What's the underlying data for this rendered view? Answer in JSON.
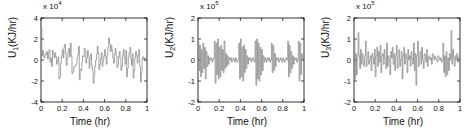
{
  "figure": {
    "background": "#ffffff",
    "line_color": "#808080",
    "axis_color": "#000000",
    "text_color": "#111111"
  },
  "chart_data": [
    {
      "type": "line",
      "title": "",
      "subplot_index": 1,
      "xlabel": "Time (hr)",
      "ylabel": "U_1(KJ/hr)",
      "ylabel_base": "U",
      "ylabel_sub": "1",
      "ylabel_unit": "(KJ/hr)",
      "exponent_prefix": "x 10",
      "exponent_power": "4",
      "y_scale": 10000,
      "xlim": [
        0,
        1
      ],
      "ylim": [
        -4,
        4
      ],
      "xticks": [
        "0",
        "0.2",
        "0.4",
        "0.6",
        "0.8",
        "1"
      ],
      "xtick_values": [
        0,
        0.2,
        0.4,
        0.6,
        0.8,
        1
      ],
      "yticks": [
        "4",
        "2",
        "0",
        "-2",
        "-4"
      ],
      "ytick_values": [
        4,
        2,
        0,
        -2,
        -4
      ],
      "grid": false,
      "legend": null,
      "drawstyle": "steps-post",
      "values": [
        3.1,
        0.4,
        0.9,
        0.3,
        0.2,
        0.6,
        0.5,
        0.8,
        0.1,
        0.7,
        1.0,
        -0.2,
        0.2,
        -0.6,
        0.9,
        0.5,
        0.2,
        0.7,
        0.3,
        -0.4,
        -0.1,
        0.3,
        -1.8,
        -1.6,
        -0.3,
        0.4,
        1.0,
        0.2,
        1.2,
        1.5,
        0.6,
        -0.5,
        0.1,
        0.8,
        1.1,
        0.3,
        1.6,
        0.4,
        -1.3,
        -1.1,
        -0.7,
        -0.6,
        -0.5,
        -0.4,
        0.1,
        0.5,
        1.3,
        -1.9,
        -0.9,
        -1.0,
        -0.2,
        0.4,
        0.3,
        1.1,
        0.8,
        -0.3,
        0.2,
        0.9,
        0.4,
        -0.8,
        0.1,
        0.6,
        -0.5,
        -1.0,
        -2.2,
        -1.4,
        -0.6,
        0.0,
        0.5,
        1.3,
        0.6,
        -0.9,
        -0.4,
        0.2,
        0.7,
        -0.6,
        -0.1,
        0.4,
        1.0,
        0.3,
        -0.4,
        0.5,
        1.2,
        2.1,
        1.5,
        0.8,
        1.4,
        0.9,
        0.2,
        -0.3,
        0.6,
        1.1,
        0.4,
        -0.7,
        -0.5,
        0.3,
        0.8,
        0.1,
        -1.0,
        -0.6,
        0.5,
        1.0,
        0.2,
        -0.4,
        0.9,
        -1.6,
        -0.8,
        0.3,
        0.7,
        1.2,
        0.1,
        -0.5,
        0.6,
        -1.7,
        -1.0,
        0.2,
        0.8,
        0.4,
        -0.3,
        0.5,
        1.0,
        -0.6,
        -2.1,
        -1.2,
        0.1,
        0.3,
        0.0,
        0.2,
        -0.1,
        0.1
      ]
    },
    {
      "type": "line",
      "title": "",
      "subplot_index": 2,
      "xlabel": "Time (hr)",
      "ylabel": "U_2(KJ/hr)",
      "ylabel_base": "U",
      "ylabel_sub": "2",
      "ylabel_unit": "(KJ/hr)",
      "exponent_prefix": "x 10",
      "exponent_power": "5",
      "y_scale": 100000,
      "xlim": [
        0,
        1
      ],
      "ylim": [
        -2,
        2
      ],
      "xticks": [
        "0",
        "0.2",
        "0.4",
        "0.6",
        "0.8",
        "1"
      ],
      "xtick_values": [
        0,
        0.2,
        0.4,
        0.6,
        0.8,
        1
      ],
      "yticks": [
        "2",
        "1",
        "0",
        "-1",
        "-2"
      ],
      "ytick_values": [
        2,
        1,
        0,
        -1,
        -2
      ],
      "grid": false,
      "legend": null,
      "drawstyle": "steps-post",
      "values": [
        0.9,
        -0.5,
        0.7,
        -0.8,
        0.5,
        -0.6,
        0.8,
        -0.4,
        0.6,
        -0.9,
        0.4,
        -0.3,
        0.2,
        -0.2,
        0.1,
        0.0,
        0.1,
        -0.1,
        0.0,
        0.1,
        0.9,
        -1.1,
        0.8,
        -0.7,
        1.0,
        -0.9,
        0.6,
        -0.8,
        0.7,
        -0.5,
        0.5,
        -0.6,
        0.9,
        -0.4,
        0.3,
        -0.3,
        0.2,
        -0.2,
        0.1,
        0.0,
        0.1,
        -0.1,
        0.0,
        0.1,
        0.0,
        -0.1,
        0.1,
        0.0,
        -0.1,
        0.0,
        0.8,
        -0.9,
        1.0,
        -0.8,
        0.6,
        -1.0,
        0.7,
        -0.6,
        0.5,
        -0.4,
        0.2,
        -0.2,
        0.1,
        0.0,
        0.1,
        -0.1,
        0.0,
        0.1,
        0.0,
        -0.1,
        0.9,
        -1.2,
        1.0,
        -0.9,
        0.8,
        -1.0,
        0.6,
        -0.7,
        0.5,
        -0.5,
        0.2,
        -0.1,
        0.1,
        0.0,
        -0.1,
        0.1,
        0.0,
        0.1,
        -0.1,
        0.0,
        0.8,
        -0.6,
        0.7,
        -0.5,
        0.3,
        -0.3,
        0.1,
        0.0,
        0.1,
        -0.1,
        0.0,
        0.1,
        0.0,
        -0.1,
        0.1,
        0.0,
        -0.1,
        0.0,
        0.1,
        0.0,
        0.9,
        -0.8,
        0.7,
        -0.6,
        0.4,
        -0.4,
        0.2,
        -0.2,
        0.1,
        0.0,
        0.1,
        -0.1,
        0.0,
        0.9,
        -1.0,
        0.8,
        -0.7,
        0.3,
        0.0,
        0.1
      ]
    },
    {
      "type": "line",
      "title": "",
      "subplot_index": 3,
      "xlabel": "Time (hr)",
      "ylabel": "U_3(KJ/hr)",
      "ylabel_base": "U",
      "ylabel_sub": "3",
      "ylabel_unit": "(KJ/hr)",
      "exponent_prefix": "x 10",
      "exponent_power": "5",
      "y_scale": 100000,
      "xlim": [
        0,
        1
      ],
      "ylim": [
        -2,
        2
      ],
      "xticks": [
        "0",
        "0.2",
        "0.4",
        "0.6",
        "0.8",
        "1"
      ],
      "xtick_values": [
        0,
        0.2,
        0.4,
        0.6,
        0.8,
        1
      ],
      "yticks": [
        "2",
        "1",
        "0",
        "-1",
        "-2"
      ],
      "ytick_values": [
        2,
        1,
        0,
        -1,
        -2
      ],
      "grid": false,
      "legend": null,
      "drawstyle": "steps-post",
      "values": [
        1.0,
        -0.9,
        0.3,
        -0.7,
        0.1,
        1.3,
        0.2,
        -0.4,
        0.5,
        -0.2,
        0.3,
        0.0,
        -0.3,
        0.2,
        0.9,
        -0.3,
        0.1,
        0.4,
        -0.2,
        0.0,
        0.2,
        -0.5,
        0.3,
        0.1,
        -0.2,
        0.5,
        -0.8,
        0.2,
        0.6,
        -0.3,
        0.4,
        -0.1,
        0.7,
        -0.6,
        0.2,
        0.3,
        -0.2,
        0.5,
        0.1,
        -0.4,
        0.8,
        -0.3,
        0.2,
        0.0,
        -0.7,
        0.4,
        0.1,
        0.6,
        -0.2,
        0.3,
        -0.5,
        0.2,
        0.7,
        -0.4,
        0.1,
        0.5,
        -0.3,
        0.0,
        0.4,
        -0.9,
        0.2,
        0.6,
        -0.2,
        0.3,
        0.1,
        -0.6,
        0.5,
        0.0,
        0.2,
        -0.3,
        0.4,
        0.1,
        -0.2,
        0.8,
        -0.5,
        0.3,
        -1.2,
        0.2,
        0.9,
        -0.3,
        0.1,
        0.4,
        -0.2,
        0.6,
        0.0,
        -0.4,
        0.3,
        0.2,
        -0.1,
        0.5,
        -0.3,
        0.1,
        0.2,
        0.0,
        0.1,
        -0.2,
        0.3,
        0.1,
        0.0,
        0.2,
        0.1,
        0.0,
        -0.1,
        0.2,
        0.1,
        0.0,
        0.1,
        -0.1,
        0.0,
        0.8,
        -0.6,
        0.2,
        -0.8,
        0.4,
        -0.7,
        0.1,
        -0.5,
        0.3,
        0.0,
        1.4,
        -0.2,
        0.5,
        0.1,
        -0.3,
        0.2,
        0.0,
        0.3,
        -0.1,
        0.1,
        0.2
      ]
    }
  ]
}
